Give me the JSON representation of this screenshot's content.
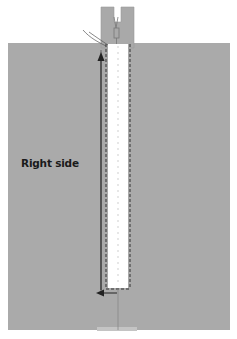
{
  "diagram": {
    "label": "Right side",
    "colors": {
      "fabric": "#aaaaaa",
      "presser_foot": "#a9a9a9",
      "zipper_tape": "#ffffff",
      "stitch": "#333333",
      "arrow": "#222222",
      "thread": "#555555"
    },
    "elements": [
      "fabric-panel",
      "presser-foot",
      "zipper-strip",
      "stitch-lines",
      "sewing-direction-arrows",
      "thread-tails"
    ]
  }
}
